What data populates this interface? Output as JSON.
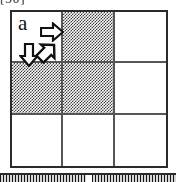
{
  "figure": {
    "panel_label": "a",
    "clipped_header_text": "[50]",
    "grid": {
      "rows": 3,
      "cols": 3,
      "cells": [
        {
          "row": 0,
          "col": 0,
          "state": "empty",
          "name": "cell-r0c0"
        },
        {
          "row": 0,
          "col": 1,
          "state": "filled",
          "name": "cell-r0c1"
        },
        {
          "row": 0,
          "col": 2,
          "state": "empty",
          "name": "cell-r0c2"
        },
        {
          "row": 1,
          "col": 0,
          "state": "filled",
          "name": "cell-r1c0"
        },
        {
          "row": 1,
          "col": 1,
          "state": "filled",
          "name": "cell-r1c1"
        },
        {
          "row": 1,
          "col": 2,
          "state": "empty",
          "name": "cell-r1c2"
        },
        {
          "row": 2,
          "col": 0,
          "state": "empty",
          "name": "cell-r2c0"
        },
        {
          "row": 2,
          "col": 1,
          "state": "empty",
          "name": "cell-r2c1"
        },
        {
          "row": 2,
          "col": 2,
          "state": "empty",
          "name": "cell-r2c2"
        }
      ],
      "filled_count": 3,
      "empty_count": 6
    },
    "arrows": [
      {
        "id": "arrow-right",
        "direction": "right",
        "rotation_deg": 0,
        "x": 30,
        "y": 12,
        "size": 22
      },
      {
        "id": "arrow-down",
        "direction": "down",
        "rotation_deg": 90,
        "x": 10,
        "y": 34,
        "size": 20
      },
      {
        "id": "arrow-diagonal",
        "direction": "up-right",
        "rotation_deg": -45,
        "x": 26,
        "y": 32,
        "size": 21
      }
    ],
    "colors": {
      "outer_border": "#2b2b2b",
      "inner_border": "#55555a",
      "fill_pattern": "#3d3d3d",
      "background": "#ffffff",
      "arrow_outline": "#111111",
      "arrow_fill": "#ffffff"
    },
    "bottom_strip": {
      "present": true,
      "description": "clipped top edge of adjacent figure panel",
      "segments": [
        "left",
        "right"
      ]
    }
  }
}
